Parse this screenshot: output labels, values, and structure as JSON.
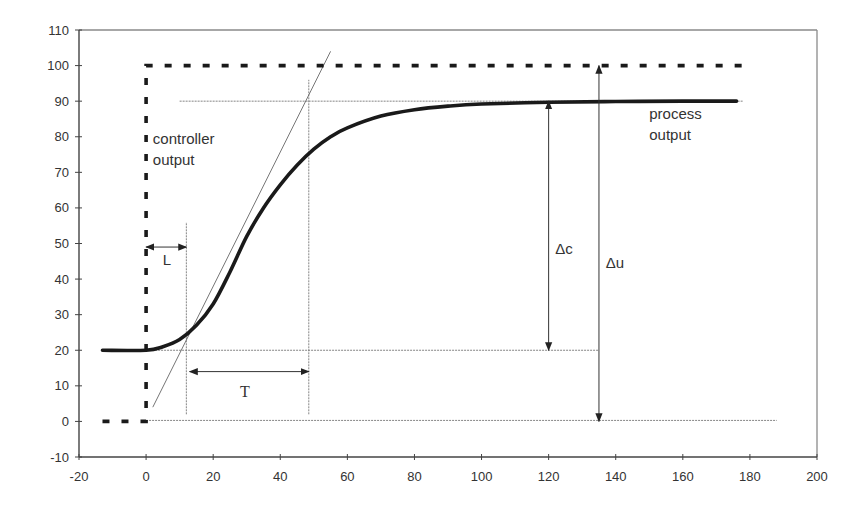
{
  "chart_data": {
    "type": "line",
    "title": "",
    "xlabel": "",
    "ylabel": "",
    "xlim": [
      -20,
      200
    ],
    "ylim": [
      -10,
      110
    ],
    "x_ticks": [
      -20,
      0,
      20,
      40,
      60,
      80,
      100,
      120,
      140,
      160,
      180,
      200
    ],
    "y_ticks": [
      -10,
      0,
      10,
      20,
      30,
      40,
      50,
      60,
      70,
      80,
      90,
      100,
      110
    ],
    "grid": false,
    "legend": "none",
    "series": [
      {
        "name": "controller output",
        "style": "dashed-thick",
        "x": [
          -13,
          0,
          0,
          178
        ],
        "y": [
          0,
          0,
          100,
          100
        ]
      },
      {
        "name": "process output",
        "style": "solid-thick",
        "x": [
          -13,
          0,
          5,
          10,
          15,
          20,
          25,
          30,
          35,
          40,
          45,
          50,
          55,
          60,
          70,
          80,
          90,
          100,
          120,
          140,
          160,
          176
        ],
        "y": [
          20,
          20,
          21,
          23,
          27,
          33,
          42,
          52,
          60,
          66.5,
          72,
          76.5,
          80,
          82.5,
          85.8,
          87.6,
          88.6,
          89.2,
          89.7,
          89.9,
          90,
          90
        ]
      }
    ],
    "construction_lines": {
      "tangent": {
        "x": [
          2,
          55
        ],
        "y": [
          4,
          104
        ]
      },
      "h_level_90": {
        "x": [
          10,
          178
        ],
        "y": 90
      },
      "h_level_20": {
        "x": [
          0,
          135
        ],
        "y": 20
      },
      "h_level_0": {
        "x": [
          0,
          188
        ],
        "y": 0
      },
      "v_L": {
        "x": 12,
        "y": [
          2,
          56
        ]
      },
      "v_T": {
        "x": 48.5,
        "y": [
          2,
          96
        ]
      }
    },
    "annotations": [
      {
        "text": "controller output",
        "lines": [
          "controller",
          "output"
        ],
        "x": 2,
        "y": 78
      },
      {
        "text": "process output",
        "lines": [
          "process",
          "output"
        ],
        "x": 150,
        "y": 85
      },
      {
        "text": "L",
        "x": 5,
        "y": 44,
        "arrow": {
          "x": [
            0,
            12
          ],
          "y": 49
        }
      },
      {
        "text": "T",
        "x": 28,
        "y": 7,
        "arrow": {
          "x": [
            13,
            48.5
          ],
          "y": 14
        }
      },
      {
        "text": "Δc",
        "x": 122,
        "y": 47,
        "arrow": {
          "x": 120,
          "y": [
            20,
            90
          ]
        }
      },
      {
        "text": "Δu",
        "x": 137,
        "y": 43,
        "arrow": {
          "x": 135,
          "y": [
            0,
            100
          ]
        }
      }
    ]
  }
}
